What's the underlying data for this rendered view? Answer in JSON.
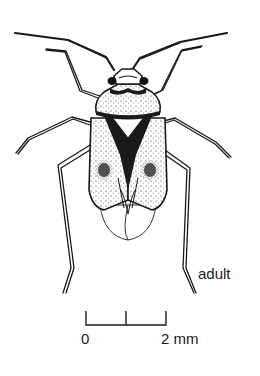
{
  "figure": {
    "stage_label": "adult",
    "scale_bar": {
      "start_label": "0",
      "end_label": "2 mm"
    },
    "colors": {
      "ink": "#1a1a1a",
      "background": "#ffffff"
    }
  }
}
